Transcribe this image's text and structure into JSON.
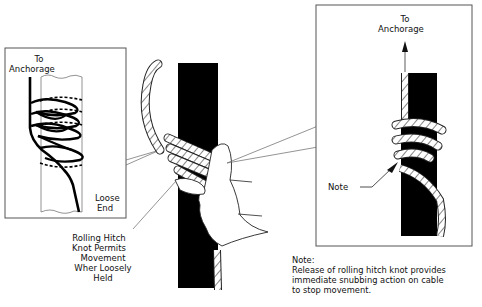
{
  "figure": {
    "left_inset": {
      "top_label_line1": "To",
      "top_label_line2": "Anchorage",
      "bottom_label_line1": "Loose",
      "bottom_label_line2": "End"
    },
    "center_callout": {
      "line1": "Rolling Hitch",
      "line2": "Knot Permits",
      "line3": "Movement",
      "line4": "Wher Loosely",
      "line5": "Held"
    },
    "right_inset": {
      "top_label_line1": "To",
      "top_label_line2": "Anchorage",
      "note_pointer_label": "Note"
    },
    "footnote": {
      "heading": "Note:",
      "line1": "Release of rolling hitch knot provides",
      "line2": "immediate snubbing action on cable",
      "line3": "to stop movement."
    },
    "colors": {
      "ink": "#111111",
      "pole": "#000000",
      "paper": "#ffffff",
      "box_border": "#555555"
    }
  }
}
